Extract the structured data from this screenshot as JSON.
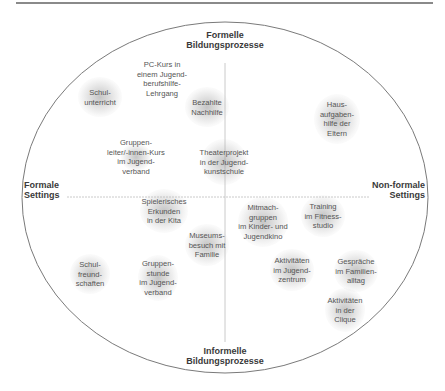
{
  "diagram": {
    "axes": {
      "top": [
        "Formelle",
        "Bildungsprozesse"
      ],
      "bottom": [
        "Informelle",
        "Bildungsprozesse"
      ],
      "left": [
        "Formale",
        "Settings"
      ],
      "right": [
        "Non-formale",
        "Settings"
      ]
    },
    "items": [
      {
        "id": "schulunterricht",
        "lines": [
          "Schul-",
          "unterricht"
        ],
        "x": 100,
        "y": 97,
        "blob": [
          44,
          40
        ]
      },
      {
        "id": "pc-kurs",
        "lines": [
          "PC-Kurs in",
          "einem Jugend-",
          "berufshilfe-",
          "Lehrgang"
        ],
        "x": 162,
        "y": 79,
        "blob": [
          0,
          0
        ]
      },
      {
        "id": "bezahlte-nachhilfe",
        "lines": [
          "Bezahlte",
          "Nachhilfe"
        ],
        "x": 207,
        "y": 107,
        "blob": [
          44,
          40
        ]
      },
      {
        "id": "hausaufgabenhilfe",
        "lines": [
          "Haus-",
          "aufgaben-",
          "hilfe der",
          "Eltern"
        ],
        "x": 337,
        "y": 119,
        "blob": [
          46,
          50
        ]
      },
      {
        "id": "gruppenleiter-kurs",
        "lines": [
          "Gruppen-",
          "leiter/-innen-Kurs",
          "im Jugend-",
          "verband"
        ],
        "x": 136,
        "y": 157,
        "blob": [
          30,
          28
        ]
      },
      {
        "id": "theaterprojekt",
        "lines": [
          "Theaterprojekt",
          "in der Jugend-",
          "kunstschule"
        ],
        "x": 224,
        "y": 162,
        "blob": [
          46,
          46
        ]
      },
      {
        "id": "spielerisches-erkunden",
        "lines": [
          "Spielerisches",
          "Erkunden",
          "in der Kita"
        ],
        "x": 164,
        "y": 211,
        "blob": [
          48,
          44
        ]
      },
      {
        "id": "mitmachgruppen",
        "lines": [
          "Mitmach-",
          "gruppen",
          "im Kinder- und",
          "Jugendkino"
        ],
        "x": 263,
        "y": 222,
        "blob": [
          50,
          50
        ]
      },
      {
        "id": "training-fitnessstudio",
        "lines": [
          "Training",
          "im Fitness-",
          "studio"
        ],
        "x": 323,
        "y": 216,
        "blob": [
          44,
          42
        ]
      },
      {
        "id": "museumsbesuch",
        "lines": [
          "Museums-",
          "besuch mit",
          "Familie"
        ],
        "x": 207,
        "y": 245,
        "blob": [
          44,
          42
        ]
      },
      {
        "id": "schulfreundschaften",
        "lines": [
          "Schul-",
          "freund-",
          "schaften"
        ],
        "x": 90,
        "y": 274,
        "blob": [
          40,
          40
        ]
      },
      {
        "id": "gruppenstunde",
        "lines": [
          "Gruppen-",
          "stunde",
          "im Jugend-",
          "verband"
        ],
        "x": 158,
        "y": 278,
        "blob": [
          40,
          46
        ]
      },
      {
        "id": "aktivitaeten-jugendzentrum",
        "lines": [
          "Aktivitäten",
          "im Jugend-",
          "zentrum"
        ],
        "x": 292,
        "y": 270,
        "blob": [
          44,
          42
        ]
      },
      {
        "id": "gespraeche-familienalltag",
        "lines": [
          "Gespräche",
          "im Familien-",
          "alltag"
        ],
        "x": 356,
        "y": 271,
        "blob": [
          44,
          42
        ]
      },
      {
        "id": "aktivitaeten-clique",
        "lines": [
          "Aktivitäten",
          "in der",
          "Clique"
        ],
        "x": 345,
        "y": 310,
        "blob": [
          40,
          44
        ]
      }
    ]
  }
}
